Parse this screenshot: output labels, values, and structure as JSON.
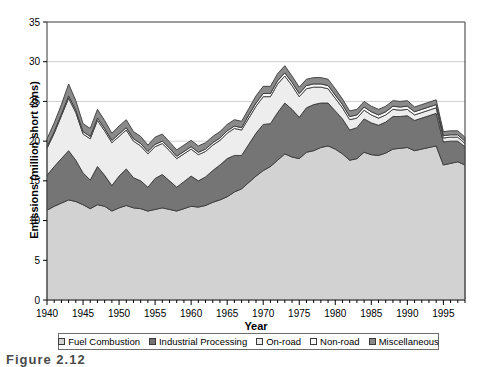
{
  "chart_data": {
    "type": "area",
    "stacked": true,
    "title": "",
    "xlabel": "Year",
    "ylabel": "Emissions (million short tons)",
    "xlim": [
      1940,
      1998
    ],
    "ylim": [
      0,
      35
    ],
    "ytick_step": 5,
    "yticks": [
      "0",
      "5",
      "10",
      "15",
      "20",
      "25",
      "30",
      "35"
    ],
    "xticks": [
      "1940",
      "1945",
      "1950",
      "1955",
      "1960",
      "1965",
      "1970",
      "1975",
      "1980",
      "1985",
      "1990",
      "1995"
    ],
    "xtick_values": [
      1940,
      1945,
      1950,
      1955,
      1960,
      1965,
      1970,
      1975,
      1980,
      1985,
      1990,
      1995
    ],
    "minor_xtick_interval": 1,
    "grid": "horizontal",
    "legend_position": "bottom",
    "colors": {
      "fuel_combustion": "#d2d2d2",
      "industrial_processing": "#757575",
      "on_road": "#ededed",
      "non_road": "#fafafa",
      "miscellaneous": "#8a8a8a",
      "outline": "#3a3a3a",
      "gridline": "#cfcfcf",
      "axis": "#555555"
    },
    "x": [
      1940,
      1941,
      1942,
      1943,
      1944,
      1945,
      1946,
      1947,
      1948,
      1949,
      1950,
      1951,
      1952,
      1953,
      1954,
      1955,
      1956,
      1957,
      1958,
      1959,
      1960,
      1961,
      1962,
      1963,
      1964,
      1965,
      1966,
      1967,
      1968,
      1969,
      1970,
      1971,
      1972,
      1973,
      1974,
      1975,
      1976,
      1977,
      1978,
      1979,
      1980,
      1981,
      1982,
      1983,
      1984,
      1985,
      1986,
      1987,
      1988,
      1989,
      1990,
      1991,
      1992,
      1993,
      1994,
      1995,
      1996,
      1997,
      1998
    ],
    "series": [
      {
        "name": "Fuel Combustion",
        "values": [
          11.3,
          11.8,
          12.2,
          12.6,
          12.4,
          12.0,
          11.5,
          12.0,
          11.8,
          11.2,
          11.6,
          11.9,
          11.6,
          11.5,
          11.2,
          11.4,
          11.6,
          11.4,
          11.2,
          11.5,
          11.8,
          11.7,
          11.9,
          12.3,
          12.6,
          13.0,
          13.6,
          14.0,
          14.8,
          15.6,
          16.3,
          16.8,
          17.6,
          18.4,
          18.0,
          17.8,
          18.6,
          18.8,
          19.2,
          19.4,
          19.0,
          18.4,
          17.6,
          17.8,
          18.6,
          18.3,
          18.2,
          18.5,
          19.0,
          19.1,
          19.2,
          18.8,
          19.0,
          19.2,
          19.4,
          17.0,
          17.2,
          17.4,
          17.0
        ]
      },
      {
        "name": "Industrial Processing",
        "values": [
          4.4,
          5.0,
          5.6,
          6.2,
          5.2,
          4.0,
          3.6,
          4.8,
          3.9,
          3.2,
          4.0,
          4.6,
          3.8,
          3.5,
          3.0,
          3.9,
          4.2,
          3.6,
          3.0,
          3.4,
          3.8,
          3.3,
          3.6,
          4.0,
          4.4,
          4.8,
          4.6,
          4.2,
          4.8,
          5.4,
          5.8,
          5.4,
          6.0,
          6.4,
          6.0,
          5.2,
          5.6,
          5.8,
          5.6,
          5.4,
          4.8,
          4.4,
          3.8,
          3.9,
          4.2,
          4.0,
          3.8,
          3.9,
          4.1,
          4.0,
          4.0,
          3.8,
          3.9,
          4.0,
          4.1,
          2.9,
          2.8,
          2.6,
          2.3
        ]
      },
      {
        "name": "On-road",
        "values": [
          3.4,
          4.2,
          5.4,
          6.6,
          6.0,
          4.9,
          5.2,
          5.8,
          5.6,
          5.4,
          5.0,
          4.9,
          4.6,
          4.4,
          4.2,
          4.0,
          3.9,
          3.8,
          3.6,
          3.5,
          3.4,
          3.3,
          3.2,
          3.2,
          3.1,
          3.2,
          3.4,
          3.2,
          3.3,
          3.4,
          3.5,
          3.4,
          3.6,
          3.4,
          3.0,
          2.6,
          2.4,
          2.2,
          2.0,
          1.8,
          1.6,
          1.4,
          1.3,
          1.2,
          1.1,
          1.0,
          0.9,
          0.9,
          0.9,
          0.8,
          0.8,
          0.7,
          0.7,
          0.7,
          0.7,
          0.5,
          0.5,
          0.5,
          0.4
        ]
      },
      {
        "name": "Non-road",
        "values": [
          0.2,
          0.2,
          0.2,
          0.3,
          0.3,
          0.3,
          0.3,
          0.3,
          0.3,
          0.3,
          0.3,
          0.3,
          0.3,
          0.3,
          0.3,
          0.3,
          0.3,
          0.3,
          0.3,
          0.3,
          0.3,
          0.3,
          0.3,
          0.3,
          0.3,
          0.3,
          0.3,
          0.3,
          0.4,
          0.4,
          0.4,
          0.4,
          0.4,
          0.4,
          0.4,
          0.4,
          0.4,
          0.4,
          0.4,
          0.4,
          0.4,
          0.4,
          0.4,
          0.4,
          0.4,
          0.4,
          0.4,
          0.4,
          0.4,
          0.4,
          0.4,
          0.4,
          0.4,
          0.4,
          0.4,
          0.3,
          0.3,
          0.3,
          0.3
        ]
      },
      {
        "name": "Miscellaneous",
        "values": [
          1.0,
          1.1,
          1.2,
          1.5,
          1.2,
          1.0,
          1.0,
          1.1,
          1.0,
          0.9,
          1.0,
          1.0,
          0.9,
          0.9,
          0.8,
          0.9,
          0.9,
          0.8,
          0.8,
          0.8,
          0.8,
          0.8,
          0.8,
          0.8,
          0.8,
          0.8,
          0.8,
          0.8,
          0.8,
          0.9,
          0.9,
          0.9,
          0.9,
          0.9,
          0.8,
          0.8,
          0.8,
          0.8,
          0.8,
          0.8,
          0.8,
          0.7,
          0.7,
          0.7,
          0.7,
          0.7,
          0.7,
          0.7,
          0.7,
          0.7,
          0.7,
          0.6,
          0.6,
          0.6,
          0.6,
          0.5,
          0.5,
          0.5,
          0.5
        ]
      }
    ],
    "totals": [
      20.3,
      22.3,
      24.6,
      27.2,
      25.1,
      22.2,
      21.6,
      24.0,
      22.6,
      21.0,
      21.9,
      22.7,
      21.2,
      20.6,
      19.5,
      20.5,
      20.9,
      19.9,
      18.9,
      19.5,
      20.1,
      19.4,
      19.8,
      20.6,
      21.2,
      22.1,
      22.7,
      22.5,
      24.1,
      25.7,
      26.9,
      26.9,
      28.5,
      29.5,
      28.2,
      26.8,
      27.8,
      28.0,
      28.0,
      27.8,
      26.6,
      25.3,
      23.8,
      24.0,
      25.0,
      24.4,
      24.0,
      24.4,
      25.1,
      25.0,
      25.1,
      24.3,
      24.6,
      24.9,
      25.2,
      21.2,
      21.3,
      21.3,
      20.5
    ]
  },
  "legend": {
    "items": [
      {
        "label": "Fuel Combustion",
        "color": "#d2d2d2"
      },
      {
        "label": "Industrial Processing",
        "color": "#757575"
      },
      {
        "label": "On-road",
        "color": "#ededed"
      },
      {
        "label": "Non-road",
        "color": "#fafafa"
      },
      {
        "label": "Miscellaneous",
        "color": "#8a8a8a"
      }
    ]
  },
  "caption": "Figure 2.12"
}
